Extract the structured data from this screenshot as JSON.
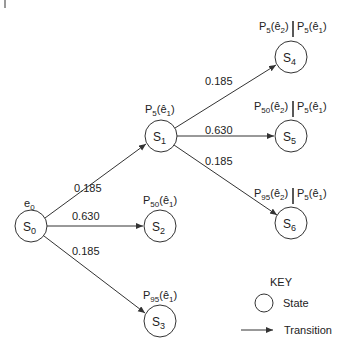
{
  "diagram": {
    "type": "state-transition-tree",
    "colors": {
      "stroke": "#333333",
      "text": "#222222",
      "background": "#ffffff"
    },
    "nodes": [
      {
        "id": "S0",
        "base": "S",
        "sub": "0",
        "cx": 31,
        "cy": 226,
        "annotation": {
          "base": "e",
          "sub": "0"
        }
      },
      {
        "id": "S1",
        "base": "S",
        "sub": "1",
        "cx": 161,
        "cy": 136,
        "annotation": {
          "text": "P5(ê1)",
          "p": "5",
          "arg": "ê",
          "argsub": "1"
        }
      },
      {
        "id": "S2",
        "base": "S",
        "sub": "2",
        "cx": 160,
        "cy": 226,
        "annotation": {
          "text": "P50(ê1)",
          "p": "50",
          "arg": "ê",
          "argsub": "1"
        }
      },
      {
        "id": "S3",
        "base": "S",
        "sub": "3",
        "cx": 160,
        "cy": 321,
        "annotation": {
          "text": "P95(ê1)",
          "p": "95",
          "arg": "ê",
          "argsub": "1"
        }
      },
      {
        "id": "S4",
        "base": "S",
        "sub": "4",
        "cx": 291,
        "cy": 57,
        "annotation": {
          "left": {
            "p": "5",
            "arg": "ê",
            "argsub": "2"
          },
          "right": {
            "p": "5",
            "arg": "ê",
            "argsub": "1"
          }
        }
      },
      {
        "id": "S5",
        "base": "S",
        "sub": "5",
        "cx": 291,
        "cy": 136,
        "annotation": {
          "left": {
            "p": "50",
            "arg": "ê",
            "argsub": "2"
          },
          "right": {
            "p": "5",
            "arg": "ê",
            "argsub": "1"
          }
        }
      },
      {
        "id": "S6",
        "base": "S",
        "sub": "6",
        "cx": 291,
        "cy": 223,
        "annotation": {
          "left": {
            "p": "95",
            "arg": "ê",
            "argsub": "2"
          },
          "right": {
            "p": "5",
            "arg": "ê",
            "argsub": "1"
          }
        }
      }
    ],
    "edges": [
      {
        "from": "S0",
        "to": "S1",
        "probability": "0.185"
      },
      {
        "from": "S0",
        "to": "S2",
        "probability": "0.630"
      },
      {
        "from": "S0",
        "to": "S3",
        "probability": "0.185"
      },
      {
        "from": "S1",
        "to": "S4",
        "probability": "0.185"
      },
      {
        "from": "S1",
        "to": "S5",
        "probability": "0.630"
      },
      {
        "from": "S1",
        "to": "S6",
        "probability": "0.185"
      }
    ],
    "key": {
      "title": "KEY",
      "state_label": "State",
      "transition_label": "Transition"
    }
  },
  "labels": {
    "e0": "e",
    "e0_sub": "0",
    "s": "S",
    "p": "P",
    "ehat": "ê",
    "sub0": "0",
    "sub1": "1",
    "sub2": "2",
    "sub3": "3",
    "sub4": "4",
    "sub5": "5",
    "sub6": "6",
    "p5": "5",
    "p50": "50",
    "p95": "95",
    "open": "(",
    "close": ")",
    "prob_s0_s1": "0.185",
    "prob_s0_s2": "0.630",
    "prob_s0_s3": "0.185",
    "prob_s1_s4": "0.185",
    "prob_s1_s5": "0.630",
    "prob_s1_s6": "0.185"
  }
}
